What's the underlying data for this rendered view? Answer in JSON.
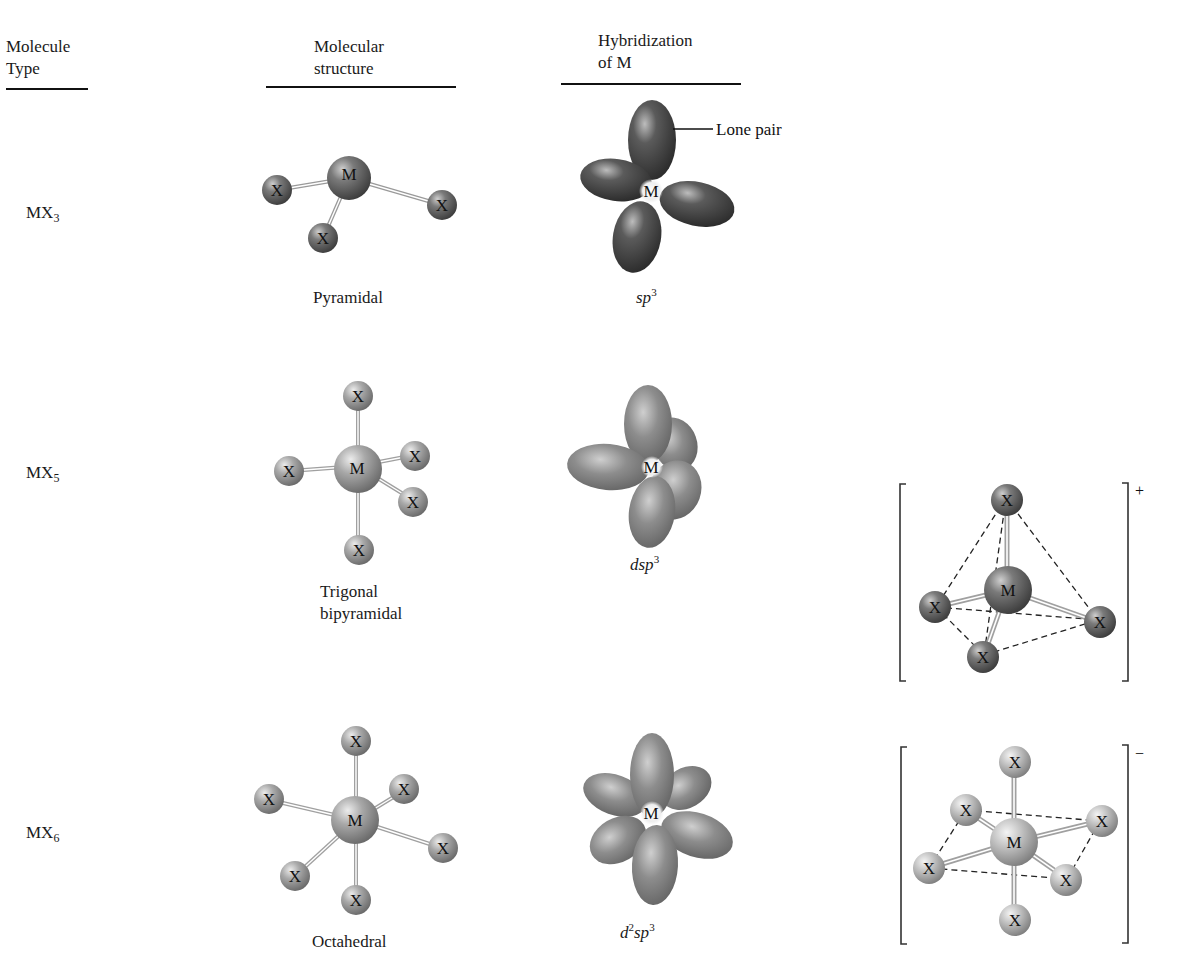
{
  "headers": {
    "molecule_type": [
      "Molecule",
      "Type"
    ],
    "molecular_structure": [
      "Molecular",
      "structure"
    ],
    "hybridization": [
      "Hybridization",
      "of M"
    ]
  },
  "rows": [
    {
      "type_base": "MX",
      "type_sub": "3",
      "structure": [
        "Pyramidal"
      ],
      "hyb_parts": [
        {
          "t": "sp"
        },
        {
          "sup": "3"
        }
      ],
      "hyb_text": "sp3",
      "annotation": "Lone pair",
      "center_label": "M",
      "ligand_label": "X",
      "ligand_count": 3,
      "shade": "dark"
    },
    {
      "type_base": "MX",
      "type_sub": "5",
      "structure": [
        "Trigonal",
        "bipyramidal"
      ],
      "hyb_text": "dsp3",
      "center_label": "M",
      "ligand_label": "X",
      "ligand_count": 5,
      "shade": "medium",
      "ion": {
        "shape": "tetrahedral",
        "ligand_count": 4,
        "charge": "+"
      }
    },
    {
      "type_base": "MX",
      "type_sub": "6",
      "structure": [
        "Octahedral"
      ],
      "hyb_text": "d2sp3",
      "center_label": "M",
      "ligand_label": "X",
      "ligand_count": 6,
      "shade": "light",
      "ion": {
        "shape": "octahedral",
        "ligand_count": 6,
        "charge": "−"
      }
    }
  ],
  "colors": {
    "sphere_dark": "#5a5a5a",
    "sphere_medium": "#8c8c8c",
    "sphere_light": "#a8a8a8",
    "lobe_dark": "#3c3c3c",
    "lobe_medium": "#7a7a7a",
    "text": "#1a1a1a",
    "rule": "#111111"
  }
}
